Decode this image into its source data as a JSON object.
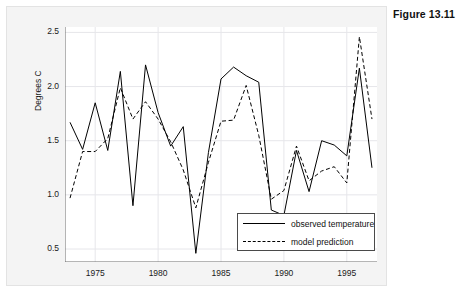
{
  "figure": {
    "title": "Figure 13.11"
  },
  "chart_data": {
    "type": "line",
    "title": "",
    "xlabel": "",
    "ylabel": "Degrees C",
    "xlim": [
      1972.6,
      1997.4
    ],
    "ylim": [
      0.38,
      2.55
    ],
    "grid": true,
    "legend_position": "bottom-right-inside",
    "xticks": [
      1975,
      1980,
      1985,
      1990,
      1995
    ],
    "xtick_labels": [
      "1975",
      "1980",
      "1985",
      "1990",
      "1995"
    ],
    "yticks": [
      0.5,
      1.0,
      1.5,
      2.0,
      2.5
    ],
    "ytick_labels": [
      "0.5",
      "1.0",
      "1.5",
      "2.0",
      "2.5"
    ],
    "x": [
      1973,
      1974,
      1975,
      1976,
      1977,
      1978,
      1979,
      1980,
      1981,
      1982,
      1983,
      1984,
      1985,
      1986,
      1987,
      1988,
      1989,
      1990,
      1991,
      1992,
      1993,
      1994,
      1995,
      1996,
      1997
    ],
    "series": [
      {
        "name": "observed temperature",
        "style": "solid",
        "color": "#000000",
        "values": [
          1.67,
          1.42,
          1.85,
          1.41,
          2.14,
          0.9,
          2.2,
          1.76,
          1.45,
          1.63,
          0.46,
          1.39,
          2.07,
          2.18,
          2.1,
          2.04,
          0.86,
          0.81,
          1.41,
          1.03,
          1.5,
          1.46,
          1.36,
          2.17,
          1.25
        ]
      },
      {
        "name": "model prediction",
        "style": "dashed",
        "color": "#000000",
        "values": [
          0.97,
          1.4,
          1.4,
          1.52,
          1.99,
          1.7,
          1.86,
          1.7,
          1.49,
          1.23,
          0.88,
          1.3,
          1.68,
          1.69,
          2.01,
          1.55,
          0.96,
          1.04,
          1.45,
          1.13,
          1.22,
          1.26,
          1.11,
          2.46,
          1.7
        ]
      }
    ]
  }
}
